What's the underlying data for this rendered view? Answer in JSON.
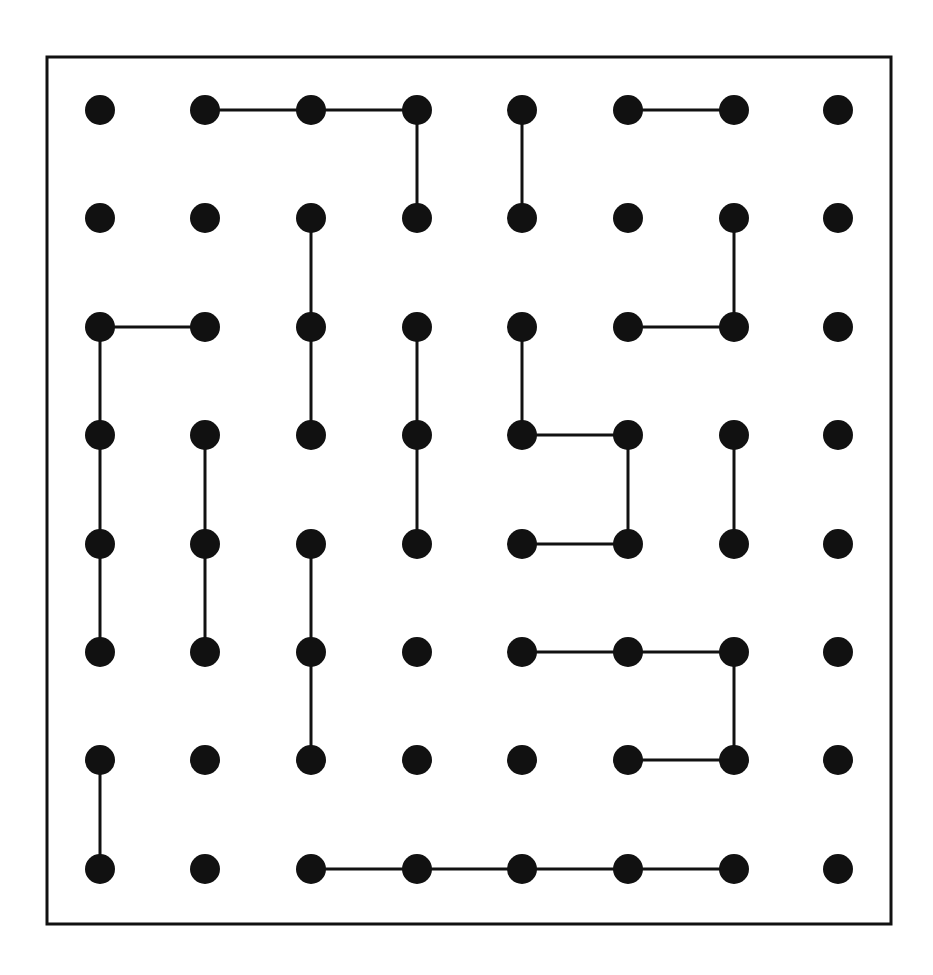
{
  "puzzle": {
    "type": "dot-grid",
    "rows": 8,
    "cols": 8,
    "colors": {
      "dot": "#111111",
      "line": "#111111",
      "border": "#111111",
      "background": "#ffffff"
    },
    "layout": {
      "border": {
        "x": 47,
        "y": 57,
        "width": 844,
        "height": 867
      },
      "col_x": [
        100,
        205,
        311,
        417,
        522,
        628,
        734,
        838
      ],
      "row_y": [
        110,
        218,
        327,
        435,
        544,
        652,
        760,
        869
      ],
      "dot_radius": 15
    },
    "edges": [
      [
        [
          0,
          1
        ],
        [
          0,
          2
        ]
      ],
      [
        [
          0,
          2
        ],
        [
          0,
          3
        ]
      ],
      [
        [
          0,
          5
        ],
        [
          0,
          6
        ]
      ],
      [
        [
          0,
          3
        ],
        [
          1,
          3
        ]
      ],
      [
        [
          0,
          4
        ],
        [
          1,
          4
        ]
      ],
      [
        [
          1,
          2
        ],
        [
          2,
          2
        ]
      ],
      [
        [
          2,
          2
        ],
        [
          3,
          2
        ]
      ],
      [
        [
          1,
          6
        ],
        [
          2,
          6
        ]
      ],
      [
        [
          2,
          5
        ],
        [
          2,
          6
        ]
      ],
      [
        [
          2,
          0
        ],
        [
          2,
          1
        ]
      ],
      [
        [
          2,
          0
        ],
        [
          3,
          0
        ]
      ],
      [
        [
          3,
          0
        ],
        [
          4,
          0
        ]
      ],
      [
        [
          4,
          0
        ],
        [
          5,
          0
        ]
      ],
      [
        [
          2,
          3
        ],
        [
          3,
          3
        ]
      ],
      [
        [
          3,
          3
        ],
        [
          4,
          3
        ]
      ],
      [
        [
          2,
          4
        ],
        [
          3,
          4
        ]
      ],
      [
        [
          3,
          4
        ],
        [
          3,
          5
        ]
      ],
      [
        [
          3,
          5
        ],
        [
          4,
          5
        ]
      ],
      [
        [
          4,
          4
        ],
        [
          4,
          5
        ]
      ],
      [
        [
          3,
          1
        ],
        [
          4,
          1
        ]
      ],
      [
        [
          4,
          1
        ],
        [
          5,
          1
        ]
      ],
      [
        [
          3,
          6
        ],
        [
          4,
          6
        ]
      ],
      [
        [
          4,
          2
        ],
        [
          5,
          2
        ]
      ],
      [
        [
          5,
          2
        ],
        [
          6,
          2
        ]
      ],
      [
        [
          5,
          4
        ],
        [
          5,
          5
        ]
      ],
      [
        [
          5,
          5
        ],
        [
          5,
          6
        ]
      ],
      [
        [
          5,
          6
        ],
        [
          6,
          6
        ]
      ],
      [
        [
          6,
          5
        ],
        [
          6,
          6
        ]
      ],
      [
        [
          6,
          0
        ],
        [
          7,
          0
        ]
      ],
      [
        [
          7,
          2
        ],
        [
          7,
          3
        ]
      ],
      [
        [
          7,
          3
        ],
        [
          7,
          4
        ]
      ],
      [
        [
          7,
          4
        ],
        [
          7,
          5
        ]
      ],
      [
        [
          7,
          5
        ],
        [
          7,
          6
        ]
      ]
    ]
  }
}
